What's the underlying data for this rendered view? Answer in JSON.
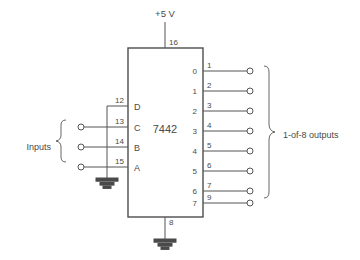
{
  "diagram": {
    "chip": {
      "name": "7442",
      "power_pin": "16",
      "power_label": "+5 V",
      "ground_pin": "8"
    },
    "inputs": {
      "group_label": "Inputs",
      "pins": [
        {
          "pin": "12",
          "letter": "D"
        },
        {
          "pin": "13",
          "letter": "C"
        },
        {
          "pin": "14",
          "letter": "B"
        },
        {
          "pin": "15",
          "letter": "A"
        }
      ]
    },
    "outputs": {
      "group_label": "1-of-8 outputs",
      "lines": [
        {
          "index": "0",
          "pin": "1"
        },
        {
          "index": "1",
          "pin": "2"
        },
        {
          "index": "2",
          "pin": "3"
        },
        {
          "index": "3",
          "pin": "4"
        },
        {
          "index": "4",
          "pin": "5"
        },
        {
          "index": "5",
          "pin": "6"
        },
        {
          "index": "6",
          "pin": "7"
        },
        {
          "index": "7",
          "pin": "9"
        }
      ]
    },
    "colors": {
      "background": "#ffffff",
      "wire": "#555555",
      "outline": "#4d4d4d",
      "text": "#4a4a4a"
    }
  }
}
